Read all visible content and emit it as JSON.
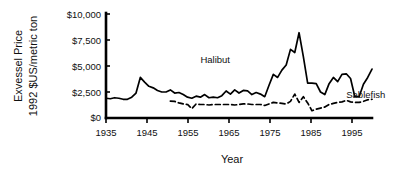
{
  "chart_data": {
    "type": "line",
    "title": "",
    "xlabel": "Year",
    "ylabel": "Exvessel Price 1992 $US/metric ton",
    "ylabel_lines": [
      "Exvessel Price",
      "1992 $US/metric ton"
    ],
    "xlim": [
      1935,
      1997
    ],
    "ylim": [
      0,
      10000
    ],
    "grid": false,
    "legend_position": "inline-annotations",
    "xticks": [
      1935,
      1945,
      1955,
      1965,
      1975,
      1985,
      1995
    ],
    "xtick_labels": [
      "1935",
      "1945",
      "1955",
      "1965",
      "1975",
      "1985",
      "1995"
    ],
    "yticks": [
      0,
      2500,
      5000,
      7500,
      10000
    ],
    "ytick_labels": [
      "$0",
      "$2,500",
      "$5,000",
      "$7,500",
      "$10,000"
    ],
    "annotations": [
      {
        "text": "Halibut",
        "x": 1957,
        "y": 5250
      },
      {
        "text": "Sablefish",
        "x": 1991,
        "y": 1950
      }
    ],
    "series": [
      {
        "name": "Halibut",
        "style": "solid",
        "color": "#000000",
        "x": [
          1935,
          1936,
          1937,
          1938,
          1939,
          1940,
          1941,
          1942,
          1943,
          1944,
          1945,
          1946,
          1947,
          1948,
          1949,
          1950,
          1951,
          1952,
          1953,
          1954,
          1955,
          1956,
          1957,
          1958,
          1959,
          1960,
          1961,
          1962,
          1963,
          1964,
          1965,
          1966,
          1967,
          1968,
          1969,
          1970,
          1971,
          1972,
          1973,
          1974,
          1975,
          1976,
          1977,
          1978,
          1979,
          1980,
          1981,
          1982,
          1983,
          1984,
          1985,
          1986,
          1987,
          1988,
          1989,
          1990,
          1991,
          1992,
          1993,
          1994,
          1995,
          1996,
          1997
        ],
        "values": [
          1900,
          1850,
          1950,
          1900,
          1800,
          1800,
          2000,
          2400,
          3900,
          3450,
          3050,
          2900,
          2650,
          2500,
          2500,
          2700,
          2400,
          2450,
          2250,
          2000,
          1900,
          2100,
          2000,
          2250,
          1950,
          2000,
          1950,
          2150,
          2600,
          2300,
          2700,
          2400,
          2650,
          2600,
          2250,
          2450,
          2300,
          2050,
          3150,
          4200,
          3900,
          4600,
          5100,
          6600,
          6300,
          8200,
          5900,
          3350,
          3350,
          3300,
          2500,
          2250,
          3300,
          3900,
          3500,
          4200,
          4250,
          3800,
          2050,
          2050,
          3250,
          3900,
          4700
        ]
      },
      {
        "name": "Sablefish",
        "style": "dashed",
        "color": "#000000",
        "x": [
          1950,
          1951,
          1952,
          1953,
          1954,
          1955,
          1956,
          1957,
          1958,
          1959,
          1960,
          1961,
          1962,
          1963,
          1964,
          1965,
          1966,
          1967,
          1968,
          1969,
          1970,
          1971,
          1972,
          1973,
          1974,
          1975,
          1976,
          1977,
          1978,
          1979,
          1980,
          1981,
          1982,
          1983,
          1984,
          1985,
          1986,
          1987,
          1988,
          1989,
          1990,
          1991,
          1992,
          1993,
          1994,
          1995,
          1996,
          1997
        ],
        "values": [
          1620,
          1600,
          1450,
          1350,
          1300,
          900,
          1350,
          1300,
          1300,
          1250,
          1300,
          1300,
          1300,
          1300,
          1300,
          1250,
          1300,
          1350,
          1350,
          1300,
          1300,
          1300,
          1200,
          1350,
          1500,
          1450,
          1400,
          1350,
          1600,
          2300,
          1500,
          2050,
          1450,
          700,
          850,
          950,
          1050,
          1300,
          1400,
          1500,
          1550,
          1700,
          1550,
          1500,
          1500,
          1600,
          1750,
          1800
        ]
      }
    ]
  },
  "plot_geometry": {
    "left": 106,
    "right": 372,
    "top": 14,
    "bottom": 118
  }
}
